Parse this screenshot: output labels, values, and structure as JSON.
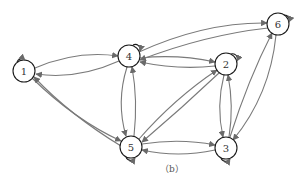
{
  "diagram": {
    "type": "directed-graph",
    "caption": "（b）",
    "nodes": [
      {
        "id": "1",
        "label": "1",
        "x": 24,
        "y": 71
      },
      {
        "id": "2",
        "label": "2",
        "x": 226,
        "y": 64
      },
      {
        "id": "3",
        "label": "3",
        "x": 226,
        "y": 148
      },
      {
        "id": "4",
        "label": "4",
        "x": 129,
        "y": 56
      },
      {
        "id": "5",
        "label": "5",
        "x": 131,
        "y": 147
      },
      {
        "id": "6",
        "label": "6",
        "x": 278,
        "y": 24
      }
    ],
    "edges": [
      {
        "from": "1",
        "to": "4"
      },
      {
        "from": "4",
        "to": "1"
      },
      {
        "from": "1",
        "to": "5"
      },
      {
        "from": "5",
        "to": "1"
      },
      {
        "from": "4",
        "to": "5"
      },
      {
        "from": "5",
        "to": "4"
      },
      {
        "from": "4",
        "to": "2"
      },
      {
        "from": "2",
        "to": "4"
      },
      {
        "from": "4",
        "to": "6"
      },
      {
        "from": "6",
        "to": "4"
      },
      {
        "from": "5",
        "to": "2"
      },
      {
        "from": "2",
        "to": "5"
      },
      {
        "from": "5",
        "to": "3"
      },
      {
        "from": "3",
        "to": "5"
      },
      {
        "from": "2",
        "to": "3"
      },
      {
        "from": "3",
        "to": "2"
      },
      {
        "from": "3",
        "to": "6"
      },
      {
        "from": "6",
        "to": "3"
      }
    ],
    "self_loops": [
      "1",
      "2",
      "3",
      "4",
      "5",
      "6"
    ],
    "colors": {
      "edge": "#7a7a7a",
      "node_stroke": "#1a1a1a",
      "background": "#ffffff"
    }
  }
}
